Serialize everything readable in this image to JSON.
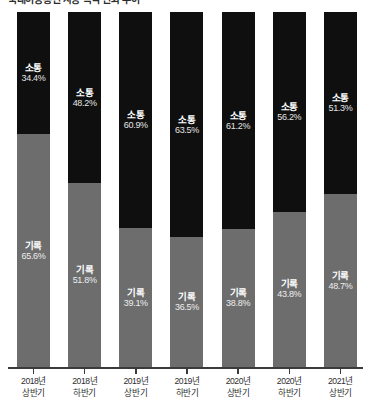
{
  "top_caption": "국내이동통신 사용 목적 변화 추이",
  "chart_data": {
    "type": "bar",
    "subtype": "stacked-100-percent",
    "title": "",
    "xlabel": "",
    "ylabel": "",
    "ylim": [
      0,
      100
    ],
    "grid": false,
    "legend": "in-bar-labels",
    "categories": [
      "2018년 상반기",
      "2018년 하반기",
      "2019년 상반기",
      "2019년 하반기",
      "2020년 상반기",
      "2020년 하반기",
      "2021년 상반기"
    ],
    "category_lines": [
      [
        "2018년",
        "상반기"
      ],
      [
        "2018년",
        "하반기"
      ],
      [
        "2019년",
        "상반기"
      ],
      [
        "2019년",
        "하반기"
      ],
      [
        "2020년",
        "상반기"
      ],
      [
        "2020년",
        "하반기"
      ],
      [
        "2021년",
        "상반기"
      ]
    ],
    "series": [
      {
        "name": "소통",
        "color": "#0f0f0f",
        "values": [
          34.4,
          48.2,
          60.9,
          63.5,
          61.2,
          56.2,
          51.3
        ],
        "value_labels": [
          "34.4%",
          "48.2%",
          "60.9%",
          "63.5%",
          "61.2%",
          "56.2%",
          "51.3%"
        ]
      },
      {
        "name": "기록",
        "color": "#6d6d6d",
        "values": [
          65.6,
          51.8,
          39.1,
          36.5,
          38.8,
          43.8,
          48.7
        ],
        "value_labels": [
          "65.6%",
          "51.8%",
          "39.1%",
          "36.5%",
          "38.8%",
          "43.8%",
          "48.7%"
        ]
      }
    ]
  },
  "bars": [
    {
      "category_line1": "2018년",
      "category_line2": "상반기",
      "top_name": "소통",
      "top_value": "34.4%",
      "top_pct": 34.4,
      "bottom_name": "기록",
      "bottom_value": "65.6%",
      "bottom_pct": 65.6
    },
    {
      "category_line1": "2018년",
      "category_line2": "하반기",
      "top_name": "소통",
      "top_value": "48.2%",
      "top_pct": 48.2,
      "bottom_name": "기록",
      "bottom_value": "51.8%",
      "bottom_pct": 51.8
    },
    {
      "category_line1": "2019년",
      "category_line2": "상반기",
      "top_name": "소통",
      "top_value": "60.9%",
      "top_pct": 60.9,
      "bottom_name": "기록",
      "bottom_value": "39.1%",
      "bottom_pct": 39.1
    },
    {
      "category_line1": "2019년",
      "category_line2": "하반기",
      "top_name": "소통",
      "top_value": "63.5%",
      "top_pct": 63.5,
      "bottom_name": "기록",
      "bottom_value": "36.5%",
      "bottom_pct": 36.5
    },
    {
      "category_line1": "2020년",
      "category_line2": "상반기",
      "top_name": "소통",
      "top_value": "61.2%",
      "top_pct": 61.2,
      "bottom_name": "기록",
      "bottom_value": "38.8%",
      "bottom_pct": 38.8
    },
    {
      "category_line1": "2020년",
      "category_line2": "하반기",
      "top_name": "소통",
      "top_value": "56.2%",
      "top_pct": 56.2,
      "bottom_name": "기록",
      "bottom_value": "43.8%",
      "bottom_pct": 43.8
    },
    {
      "category_line1": "2021년",
      "category_line2": "상반기",
      "top_name": "소통",
      "top_value": "51.3%",
      "top_pct": 51.3,
      "bottom_name": "기록",
      "bottom_value": "48.7%",
      "bottom_pct": 48.7
    }
  ],
  "colors": {
    "series_top": "#0f0f0f",
    "series_bottom": "#6d6d6d",
    "axis": "#3a3a3a",
    "background": "#ffffff",
    "label_text": "#2e2e2e"
  }
}
